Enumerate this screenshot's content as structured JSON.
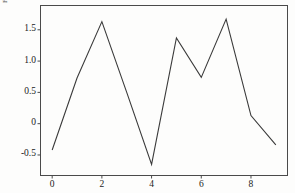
{
  "chart_data": {
    "type": "line",
    "title": "",
    "xlabel": "",
    "ylabel": "",
    "x": [
      0,
      1,
      2,
      3,
      4,
      5,
      6,
      7,
      8,
      9
    ],
    "values": [
      -0.42,
      0.73,
      1.63,
      0.5,
      -0.65,
      1.37,
      0.74,
      1.67,
      0.13,
      -0.34
    ],
    "series": [
      {
        "name": "series-1",
        "values": [
          -0.42,
          0.73,
          1.63,
          0.5,
          -0.65,
          1.37,
          0.74,
          1.67,
          0.13,
          -0.34
        ],
        "color": "#3a3a3a"
      }
    ],
    "xlim": [
      -0.45,
      9.45
    ],
    "ylim": [
      -0.82,
      1.88
    ],
    "xticks": [
      0,
      2,
      4,
      6,
      8
    ],
    "xtick_labels": [
      "0",
      "2",
      "4",
      "6",
      "8"
    ],
    "yticks": [
      -0.5,
      0,
      0.5,
      1.0,
      1.5
    ],
    "ytick_labels": [
      "-0.5",
      "0",
      "0.5",
      "1.0",
      "1.5"
    ],
    "grid": false,
    "legend": null,
    "frame": true,
    "line_color": "#3a3a3a",
    "line_width": 1.1,
    "background": "#fdfdfc",
    "frame_color": "#4a4a4a"
  },
  "axes": {
    "y_tick_labels": [
      "1.5",
      "1.0",
      "0.5",
      "0",
      "-0.5"
    ],
    "x_tick_labels": [
      "0",
      "2",
      "4",
      "6",
      "8"
    ],
    "corner_mark": "F"
  }
}
